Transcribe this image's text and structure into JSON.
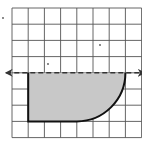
{
  "figure": {
    "grid": {
      "cols": 8,
      "rows": 8,
      "origin_x": 12,
      "origin_y": 8,
      "cell": 16.2,
      "line_color": "#555555",
      "background": "#ffffff"
    },
    "dashed_line": {
      "row": 4,
      "from_col": -0.6,
      "to_col": 8.4,
      "color": "#333333",
      "arrows": "both"
    },
    "shaded_region": {
      "fill": "#c8c8c8",
      "stroke": "#111111",
      "left_col": 1,
      "right_col": 7,
      "top_row": 4,
      "bottom_row": 7,
      "curve_start_col": 4,
      "curve_radius_cells": 3
    },
    "dots": [
      {
        "x": 3,
        "y": 18
      },
      {
        "x": 48,
        "y": 64
      },
      {
        "x": 100,
        "y": 45
      }
    ]
  }
}
